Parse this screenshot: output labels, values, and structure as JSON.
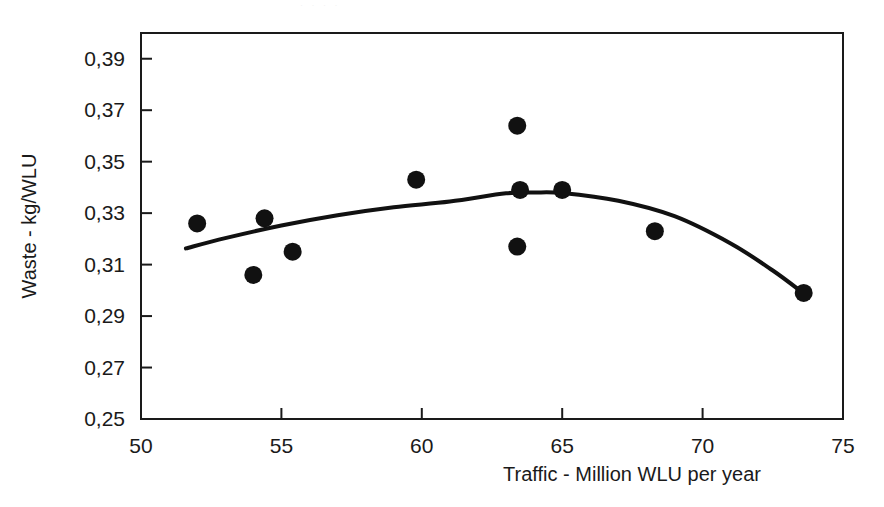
{
  "chart_data": {
    "type": "scatter",
    "title": "",
    "xlabel": "Traffic - Million  WLU per year",
    "ylabel": "Waste - kg/WLU",
    "xlim": [
      50,
      75
    ],
    "ylim": [
      0.25,
      0.4
    ],
    "xticks": [
      "50",
      "55",
      "60",
      "65",
      "70",
      "75"
    ],
    "xtick_values": [
      50,
      55,
      60,
      65,
      70,
      75
    ],
    "yticks": [
      "0,25",
      "0,27",
      "0,29",
      "0,31",
      "0,33",
      "0,35",
      "0,37",
      "0,39"
    ],
    "ytick_values": [
      0.25,
      0.27,
      0.29,
      0.31,
      0.33,
      0.35,
      0.37,
      0.39
    ],
    "grid": false,
    "legend": "none",
    "decimal_separator": ",",
    "marker": {
      "shape": "circle",
      "color": "#111111",
      "size": 9
    },
    "points": [
      {
        "x": 52.0,
        "y": 0.326
      },
      {
        "x": 54.0,
        "y": 0.306
      },
      {
        "x": 54.4,
        "y": 0.328
      },
      {
        "x": 55.4,
        "y": 0.315
      },
      {
        "x": 59.8,
        "y": 0.343
      },
      {
        "x": 63.4,
        "y": 0.364
      },
      {
        "x": 63.4,
        "y": 0.317
      },
      {
        "x": 63.5,
        "y": 0.339
      },
      {
        "x": 65.0,
        "y": 0.339
      },
      {
        "x": 68.3,
        "y": 0.323
      },
      {
        "x": 73.6,
        "y": 0.299
      }
    ],
    "series": [
      {
        "name": "trend",
        "type": "line",
        "color": "#111111",
        "width": 4,
        "x": [
          51.6,
          53.0,
          55.0,
          57.0,
          59.0,
          61.0,
          63.0,
          64.0,
          65.0,
          67.0,
          69.0,
          71.0,
          72.5,
          73.6
        ],
        "y": [
          0.3163,
          0.3203,
          0.3252,
          0.3292,
          0.3323,
          0.3345,
          0.3377,
          0.338,
          0.3378,
          0.3348,
          0.3288,
          0.3182,
          0.3077,
          0.2988
        ]
      }
    ]
  },
  "axes": {
    "frame_color": "#1a1a1a",
    "frame_width": 2
  },
  "artifact": {
    "top_smudge": "· ·          ·     ·"
  }
}
